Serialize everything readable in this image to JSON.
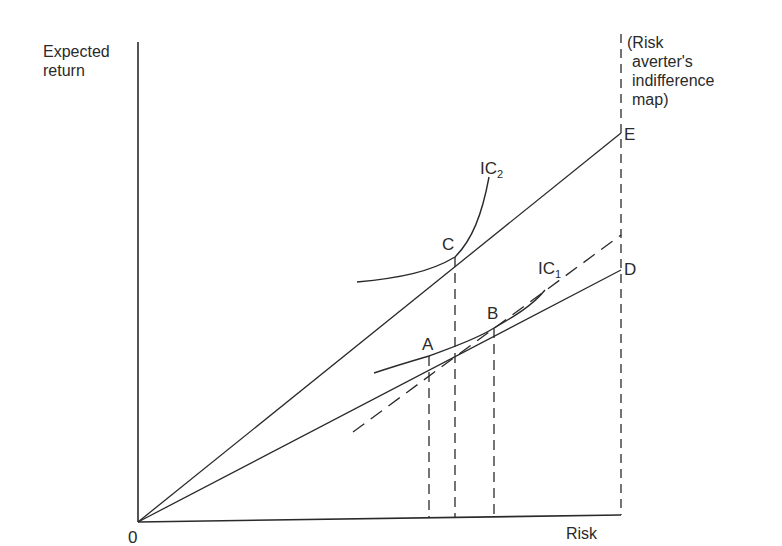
{
  "diagram": {
    "title": "Risk averter's indifference map",
    "axes": {
      "y_label_line1": "Expected",
      "y_label_line2": "return",
      "x_label": "Risk",
      "origin_label": "0"
    },
    "annotation": {
      "line1": "(Risk",
      "line2": "averter's",
      "line3": "indifference",
      "line4": "map)"
    },
    "points": {
      "A": "A",
      "B": "B",
      "C": "C",
      "D": "D",
      "E": "E"
    },
    "curves": {
      "ic1_main": "IC",
      "ic1_sub": "1",
      "ic2_main": "IC",
      "ic2_sub": "2"
    },
    "lines": [
      {
        "name": "0E",
        "style": "solid",
        "from": "0",
        "to": "E",
        "through": "C"
      },
      {
        "name": "0D",
        "style": "solid",
        "from": "0",
        "to": "D",
        "through": [
          "A",
          "B"
        ]
      },
      {
        "name": "dashed-tangent",
        "style": "dashed",
        "through": "B"
      },
      {
        "name": "vertical-boundary",
        "style": "dashed",
        "at": "D/E"
      }
    ],
    "colors": {
      "ink": "#2a2a2a",
      "background": "#ffffff"
    }
  }
}
